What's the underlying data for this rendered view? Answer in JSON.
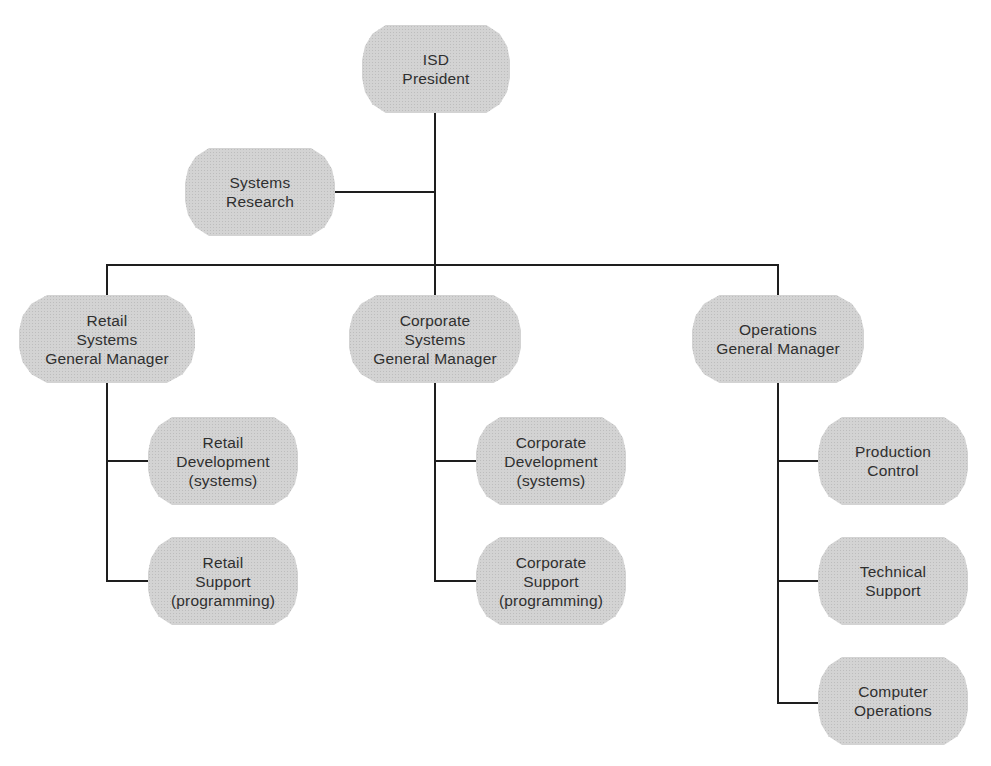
{
  "diagram": {
    "type": "org-chart",
    "line_color": "#1e1e1e",
    "node_fill": "#d3d3d3",
    "text_color": "#2f2f2f",
    "root": {
      "id": "isd-president",
      "label": "ISD\nPresident"
    },
    "staff": {
      "id": "systems-research",
      "label": "Systems\nResearch"
    },
    "divisions": [
      {
        "id": "retail-systems-gm",
        "label": "Retail\nSystems\nGeneral Manager",
        "children": [
          {
            "id": "retail-development",
            "label": "Retail\nDevelopment\n(systems)"
          },
          {
            "id": "retail-support",
            "label": "Retail\nSupport\n(programming)"
          }
        ]
      },
      {
        "id": "corporate-systems-gm",
        "label": "Corporate\nSystems\nGeneral Manager",
        "children": [
          {
            "id": "corporate-development",
            "label": "Corporate\nDevelopment\n(systems)"
          },
          {
            "id": "corporate-support",
            "label": "Corporate\nSupport\n(programming)"
          }
        ]
      },
      {
        "id": "operations-gm",
        "label": "Operations\nGeneral Manager",
        "children": [
          {
            "id": "production-control",
            "label": "Production\nControl"
          },
          {
            "id": "technical-support",
            "label": "Technical\nSupport"
          },
          {
            "id": "computer-operations",
            "label": "Computer\nOperations"
          }
        ]
      }
    ]
  }
}
